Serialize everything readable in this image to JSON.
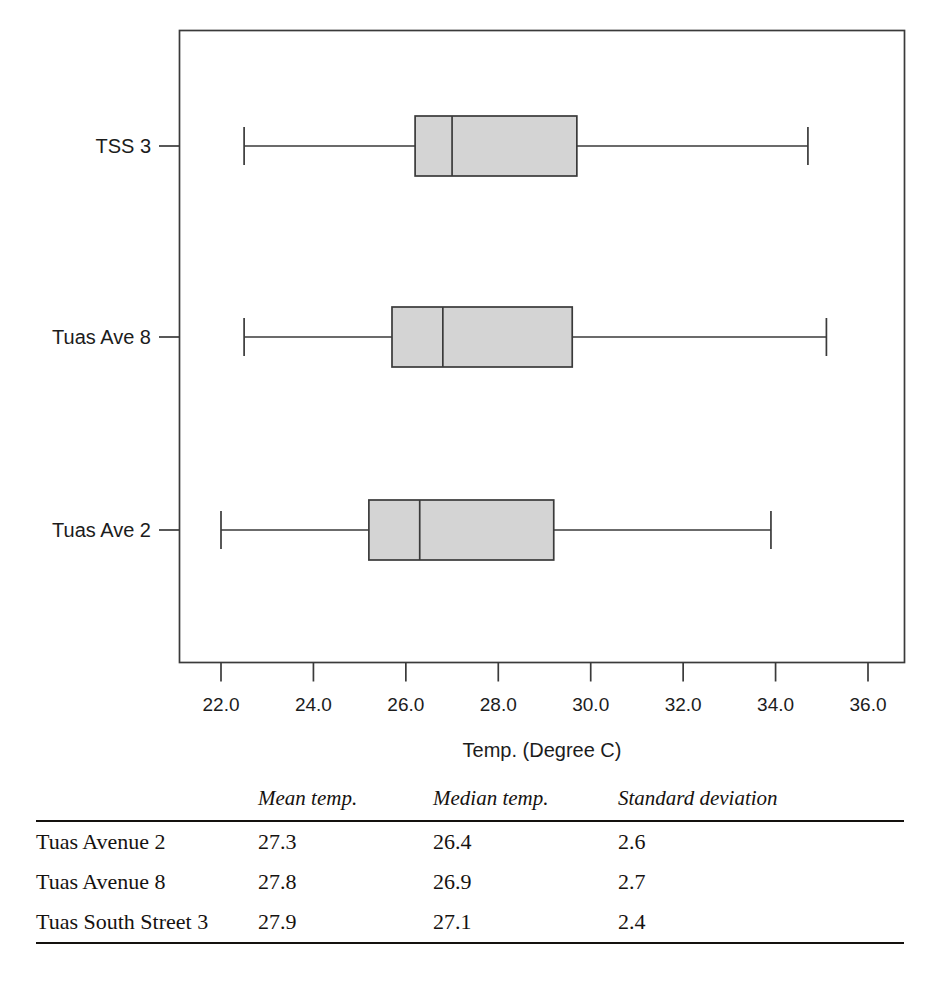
{
  "chart_data": {
    "type": "boxplot",
    "title": "",
    "xlabel": "Temp. (Degree C)",
    "ylabel": "",
    "xlim": [
      21.0,
      36.8
    ],
    "grid": false,
    "legend": "none",
    "orientation": "horizontal",
    "xticks": [
      "22.0",
      "24.0",
      "26.0",
      "28.0",
      "30.0",
      "32.0",
      "34.0",
      "36.0"
    ],
    "xtick_values": [
      22.0,
      24.0,
      26.0,
      28.0,
      30.0,
      32.0,
      34.0,
      36.0
    ],
    "categories": [
      "Tuas Ave 2",
      "Tuas Ave 8",
      "TSS 3"
    ],
    "boxes": [
      {
        "label": "TSS 3",
        "whisker_low": 22.5,
        "q1": 26.2,
        "median": 27.0,
        "q3": 29.7,
        "whisker_high": 34.7
      },
      {
        "label": "Tuas Ave 8",
        "whisker_low": 22.5,
        "q1": 25.7,
        "median": 26.8,
        "q3": 29.6,
        "whisker_high": 35.1
      },
      {
        "label": "Tuas Ave 2",
        "whisker_low": 22.0,
        "q1": 25.2,
        "median": 26.3,
        "q3": 29.2,
        "whisker_high": 33.9
      }
    ],
    "box_fill_color": "#d4d4d4",
    "box_stroke_color": "#3a3a3a",
    "axis_color": "#3a3a3a"
  },
  "stats_table": {
    "headers": [
      "",
      "Mean temp.",
      "Median temp.",
      "Standard deviation"
    ],
    "rows": [
      {
        "name": "Tuas Avenue 2",
        "mean": "27.3",
        "median": "26.4",
        "sd": "2.6"
      },
      {
        "name": "Tuas Avenue 8",
        "mean": "27.8",
        "median": "26.9",
        "sd": "2.7"
      },
      {
        "name": "Tuas South Street 3",
        "mean": "27.9",
        "median": "27.1",
        "sd": "2.4"
      }
    ]
  }
}
